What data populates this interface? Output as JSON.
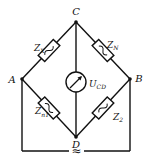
{
  "diagram": {
    "type": "AC bridge circuit",
    "nodes": {
      "A": "A",
      "B": "B",
      "C": "C",
      "D": "D"
    },
    "impedances": {
      "zx": {
        "main": "Z",
        "sub": "X",
        "branch": "A-C"
      },
      "zn": {
        "main": "Z",
        "sub": "N",
        "branch": "C-B"
      },
      "z1": {
        "main": "Z",
        "sub": "n1",
        "branch": "A-D"
      },
      "z2": {
        "main": "Z",
        "sub": "2",
        "branch": "D-B"
      }
    },
    "meter": {
      "label_main": "U",
      "label_sub": "CD",
      "branch": "C-D"
    },
    "source": {
      "symbol": "≈"
    },
    "colors": {
      "line": "#111111",
      "background": "#ffffff"
    }
  }
}
